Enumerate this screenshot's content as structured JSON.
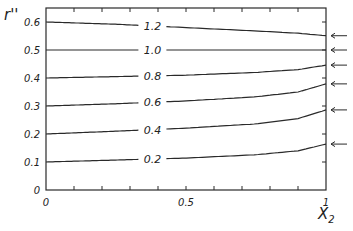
{
  "chart_data": {
    "type": "line",
    "title": "",
    "xlabel": "X",
    "xlabel_sub": "2",
    "ylabel": "r''",
    "xlim": [
      0,
      1
    ],
    "ylim": [
      0,
      0.65
    ],
    "x_ticks": [
      {
        "value": 0,
        "label": "0"
      },
      {
        "value": 0.5,
        "label": "0.5"
      },
      {
        "value": 1,
        "label": "1"
      }
    ],
    "y_ticks": [
      {
        "value": 0,
        "label": "0"
      },
      {
        "value": 0.1,
        "label": "0.1"
      },
      {
        "value": 0.2,
        "label": "0.2"
      },
      {
        "value": 0.3,
        "label": "0.3"
      },
      {
        "value": 0.4,
        "label": "0.4"
      },
      {
        "value": 0.5,
        "label": "0.5"
      },
      {
        "value": 0.6,
        "label": "0.6"
      }
    ],
    "grid": false,
    "legend": "inline labels on curves",
    "x": [
      0,
      0.25,
      0.5,
      0.75,
      0.9,
      1.0
    ],
    "series": [
      {
        "name": "1.2",
        "values": [
          0.6,
          0.592,
          0.58,
          0.568,
          0.56,
          0.551
        ]
      },
      {
        "name": "1.0",
        "values": [
          0.5,
          0.5,
          0.5,
          0.5,
          0.5,
          0.5
        ]
      },
      {
        "name": "0.8",
        "values": [
          0.4,
          0.405,
          0.41,
          0.42,
          0.43,
          0.446
        ]
      },
      {
        "name": "0.6",
        "values": [
          0.3,
          0.308,
          0.318,
          0.333,
          0.35,
          0.379
        ]
      },
      {
        "name": "0.4",
        "values": [
          0.2,
          0.21,
          0.221,
          0.236,
          0.255,
          0.286
        ]
      },
      {
        "name": "0.2",
        "values": [
          0.1,
          0.107,
          0.114,
          0.126,
          0.14,
          0.164
        ]
      }
    ],
    "annotations": {
      "arrows_at_x1": [
        0.551,
        0.5,
        0.446,
        0.379,
        0.286,
        0.164
      ],
      "arrow_direction": "left, pointing to curve endpoints on right axis"
    }
  }
}
